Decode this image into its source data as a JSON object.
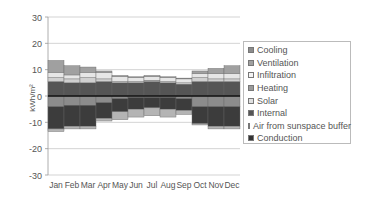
{
  "chart_data": {
    "type": "bar",
    "stacked": true,
    "title": "",
    "xlabel": "",
    "ylabel": "kWh/m²",
    "ylim": [
      -30,
      30
    ],
    "yticks": [
      30,
      20,
      10,
      0,
      -10,
      -20,
      -30
    ],
    "grid": true,
    "legend_position": "right",
    "categories": [
      "Jan",
      "Feb",
      "Mar",
      "Apr",
      "May",
      "Jun",
      "Jul",
      "Aug",
      "Sep",
      "Oct",
      "Nov",
      "Dec"
    ],
    "series": [
      {
        "name": "Cooling",
        "color": "#8c8c8c",
        "values": [
          -4,
          -3.5,
          -3.5,
          -2.5,
          -1,
          -0.5,
          -0.5,
          -0.5,
          -1,
          -4,
          -4,
          -4
        ]
      },
      {
        "name": "Ventilation",
        "color": "#a0a0a0",
        "values": [
          4.5,
          3.5,
          2,
          0.5,
          0.3,
          0.3,
          0.3,
          0.3,
          0.3,
          1,
          2,
          3
        ]
      },
      {
        "name": "Infiltration",
        "color": "#e6e6e6",
        "values": [
          2,
          1.5,
          2,
          2.5,
          2,
          1.5,
          1.5,
          1.5,
          1.5,
          1.5,
          2,
          2
        ]
      },
      {
        "name": "Heating",
        "color": "#9a9a9a",
        "values": [
          0,
          0,
          0,
          0,
          0,
          0,
          0,
          0,
          0,
          0,
          0,
          0
        ]
      },
      {
        "name": "Solar",
        "color": "#d0d0d0",
        "values": [
          1.5,
          1.5,
          2,
          1,
          0.5,
          0.5,
          0.5,
          0.5,
          0.5,
          1.5,
          1,
          1
        ]
      },
      {
        "name": "Internal",
        "color": "#555555",
        "values": [
          5.5,
          5,
          5,
          5.5,
          5,
          5,
          5.5,
          5,
          4.5,
          5.5,
          5.5,
          5.5
        ]
      },
      {
        "name": "Air from sunspace buffer",
        "color": "#b4b4b4",
        "values": [
          -1,
          -1,
          -1,
          -1,
          -3,
          -3,
          -3,
          -3,
          -1.5,
          -0.5,
          -1,
          -1
        ]
      },
      {
        "name": "Conduction",
        "color": "#3c3c3c",
        "values": [
          -8.5,
          -8,
          -8,
          -6,
          -5,
          -4.5,
          -4,
          -4.5,
          -4.5,
          -6.5,
          -7.5,
          -7.5
        ]
      }
    ]
  },
  "legend": {
    "items": [
      {
        "label": "Cooling",
        "color": "#8c8c8c"
      },
      {
        "label": "Ventilation",
        "color": "#a0a0a0"
      },
      {
        "label": "Infiltration",
        "color": "#f4f4f4"
      },
      {
        "label": "Heating",
        "color": "#9a9a9a"
      },
      {
        "label": "Solar",
        "color": "#e0e0e0"
      },
      {
        "label": "Internal",
        "color": "#555555"
      },
      {
        "label": "Air from sunspace buffer",
        "color": "#b0b0b0"
      },
      {
        "label": "Conduction",
        "color": "#333333"
      }
    ]
  },
  "axis": {
    "ylabel": "kWh/m²"
  }
}
